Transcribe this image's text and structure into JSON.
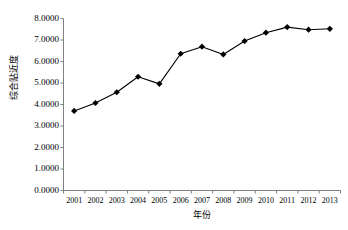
{
  "chart_data": {
    "type": "line",
    "title": "",
    "xlabel": "年份",
    "ylabel": "综合贴近度",
    "categories": [
      "2001",
      "2002",
      "2003",
      "2004",
      "2005",
      "2006",
      "2007",
      "2008",
      "2009",
      "2010",
      "2011",
      "2012",
      "2013"
    ],
    "values": [
      3.7,
      4.07,
      4.57,
      5.29,
      4.96,
      6.36,
      6.69,
      6.33,
      6.95,
      7.34,
      7.6,
      7.48,
      7.52
    ],
    "series": [
      {
        "name": "综合贴近度",
        "values": [
          3.7,
          4.07,
          4.57,
          5.29,
          4.96,
          6.36,
          6.69,
          6.33,
          6.95,
          7.34,
          7.6,
          7.48,
          7.52
        ]
      }
    ],
    "ylim": [
      0.0,
      8.0
    ],
    "ytick_values": [
      0.0,
      1.0,
      2.0,
      3.0,
      4.0,
      5.0,
      6.0,
      7.0,
      8.0
    ],
    "ytick_labels": [
      "0.0000",
      "1.0000",
      "2.0000",
      "3.0000",
      "4.0000",
      "5.0000",
      "6.0000",
      "7.0000",
      "8.0000"
    ],
    "grid": false,
    "legend": false,
    "legend_position": "none",
    "marker": "diamond",
    "line_color": "#000000",
    "marker_color": "#000000",
    "axis_color": "#808080",
    "background_color": "#ffffff"
  }
}
